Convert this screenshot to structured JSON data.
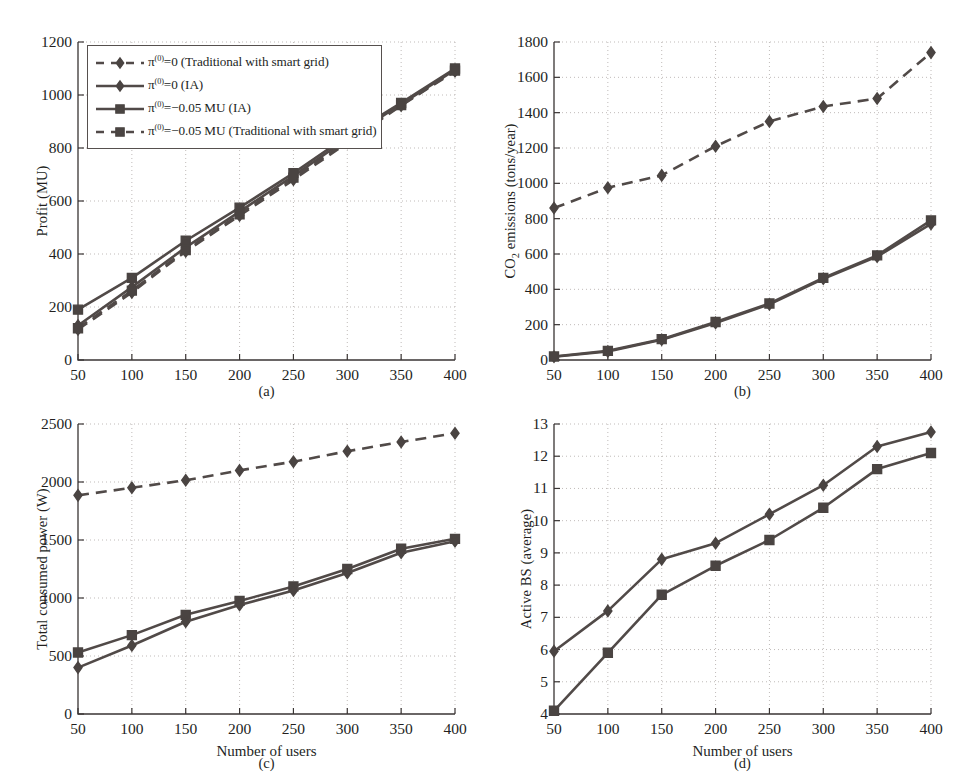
{
  "figure": {
    "colors": {
      "ink": "#3a3534",
      "line": "#514a48",
      "marker": "#4a4442",
      "grid": "#b9b3b1",
      "background": "#ffffff"
    }
  },
  "legend": {
    "items": [
      {
        "label_html": "π<sup>(0)</sup>=0 (Traditional with smart grid)",
        "marker": "diamond",
        "style": "dashed"
      },
      {
        "label_html": "π<sup>(0)</sup>=0 (IA)",
        "marker": "diamond",
        "style": "solid"
      },
      {
        "label_html": "π<sup>(0)</sup>=−0.05 MU (IA)",
        "marker": "square",
        "style": "solid"
      },
      {
        "label_html": "π<sup>(0)</sup>=−0.05 MU (Traditional with smart grid)",
        "marker": "square",
        "style": "dashed"
      }
    ]
  },
  "chart_data": [
    {
      "id": "a",
      "type": "line",
      "caption": "(a)",
      "title": "",
      "xlabel": "",
      "ylabel": "Profit (MU)",
      "x": [
        50,
        100,
        150,
        200,
        250,
        300,
        350,
        400
      ],
      "xticks": [
        "50",
        "100",
        "150",
        "200",
        "250",
        "300",
        "350",
        "400"
      ],
      "xlim": [
        50,
        400
      ],
      "ylim": [
        0,
        1200
      ],
      "yticks": [
        "0",
        "200",
        "400",
        "600",
        "800",
        "1000",
        "1200"
      ],
      "ytickvals": [
        0,
        200,
        400,
        600,
        800,
        1000,
        1200
      ],
      "grid": true,
      "series": [
        {
          "name": "π(0)=0 (Traditional with smart grid)",
          "marker": "diamond",
          "style": "dashed",
          "values": [
            115,
            255,
            410,
            545,
            680,
            820,
            960,
            1090
          ]
        },
        {
          "name": "π(0)=0 (IA)",
          "marker": "diamond",
          "style": "solid",
          "values": [
            130,
            275,
            425,
            560,
            695,
            835,
            965,
            1095
          ]
        },
        {
          "name": "π(0)=−0.05 MU (IA)",
          "marker": "square",
          "style": "solid",
          "values": [
            190,
            310,
            450,
            575,
            705,
            845,
            970,
            1100
          ]
        },
        {
          "name": "π(0)=−0.05 MU (Traditional with smart grid)",
          "marker": "square",
          "style": "dashed",
          "values": [
            120,
            262,
            415,
            550,
            688,
            826,
            962,
            1092
          ]
        }
      ]
    },
    {
      "id": "b",
      "type": "line",
      "caption": "(b)",
      "title": "",
      "xlabel": "",
      "ylabel": "CO₂ emissions (tons/year)",
      "x": [
        50,
        100,
        150,
        200,
        250,
        300,
        350,
        400
      ],
      "xticks": [
        "50",
        "100",
        "150",
        "200",
        "250",
        "300",
        "350",
        "400"
      ],
      "xlim": [
        50,
        400
      ],
      "ylim": [
        0,
        1800
      ],
      "yticks": [
        "0",
        "200",
        "400",
        "600",
        "800",
        "1000",
        "1200",
        "1400",
        "1600",
        "1800"
      ],
      "ytickvals": [
        0,
        200,
        400,
        600,
        800,
        1000,
        1200,
        1400,
        1600,
        1800
      ],
      "grid": true,
      "series": [
        {
          "name": "π(0)=0 (Traditional with smart grid)",
          "marker": "diamond",
          "style": "dashed",
          "values": [
            860,
            975,
            1045,
            1210,
            1350,
            1435,
            1480,
            1740
          ]
        },
        {
          "name": "π(0)=0 (IA)",
          "marker": "diamond",
          "style": "solid",
          "values": [
            18,
            48,
            115,
            210,
            315,
            460,
            585,
            770
          ]
        },
        {
          "name": "π(0)=−0.05 MU (IA)",
          "marker": "square",
          "style": "solid",
          "values": [
            20,
            52,
            118,
            215,
            320,
            465,
            592,
            790
          ]
        }
      ]
    },
    {
      "id": "c",
      "type": "line",
      "caption": "(c)",
      "title": "",
      "xlabel": "Number of users",
      "ylabel": "Total consumed power (W)",
      "x": [
        50,
        100,
        150,
        200,
        250,
        300,
        350,
        400
      ],
      "xticks": [
        "50",
        "100",
        "150",
        "200",
        "250",
        "300",
        "350",
        "400"
      ],
      "xlim": [
        50,
        400
      ],
      "ylim": [
        0,
        2500
      ],
      "yticks": [
        "0",
        "500",
        "1000",
        "1500",
        "2000",
        "2500"
      ],
      "ytickvals": [
        0,
        500,
        1000,
        1500,
        2000,
        2500
      ],
      "grid": true,
      "series": [
        {
          "name": "π(0)=0 (Traditional with smart grid)",
          "marker": "diamond",
          "style": "dashed",
          "values": [
            1885,
            1950,
            2015,
            2100,
            2175,
            2265,
            2345,
            2420
          ]
        },
        {
          "name": "π(0)=−0.05 MU (IA)",
          "marker": "square",
          "style": "solid",
          "values": [
            530,
            680,
            855,
            975,
            1100,
            1250,
            1425,
            1510
          ]
        },
        {
          "name": "π(0)=0 (IA)",
          "marker": "diamond",
          "style": "solid",
          "values": [
            400,
            590,
            795,
            940,
            1065,
            1215,
            1390,
            1490
          ]
        }
      ]
    },
    {
      "id": "d",
      "type": "line",
      "caption": "(d)",
      "title": "",
      "xlabel": "Number of users",
      "ylabel": "Active BS (average)",
      "x": [
        50,
        100,
        150,
        200,
        250,
        300,
        350,
        400
      ],
      "xticks": [
        "50",
        "100",
        "150",
        "200",
        "250",
        "300",
        "350",
        "400"
      ],
      "xlim": [
        50,
        400
      ],
      "ylim": [
        4,
        13
      ],
      "yticks": [
        "4",
        "5",
        "6",
        "7",
        "8",
        "9",
        "10",
        "11",
        "12",
        "13"
      ],
      "ytickvals": [
        4,
        5,
        6,
        7,
        8,
        9,
        10,
        11,
        12,
        13
      ],
      "grid": true,
      "series": [
        {
          "name": "π(0)=0 (IA)",
          "marker": "diamond",
          "style": "solid",
          "values": [
            5.95,
            7.2,
            8.8,
            9.3,
            10.2,
            11.1,
            12.3,
            12.75
          ]
        },
        {
          "name": "π(0)=−0.05 MU (IA)",
          "marker": "square",
          "style": "solid",
          "values": [
            4.1,
            5.9,
            7.7,
            8.6,
            9.4,
            10.4,
            11.6,
            12.1
          ]
        }
      ]
    }
  ]
}
